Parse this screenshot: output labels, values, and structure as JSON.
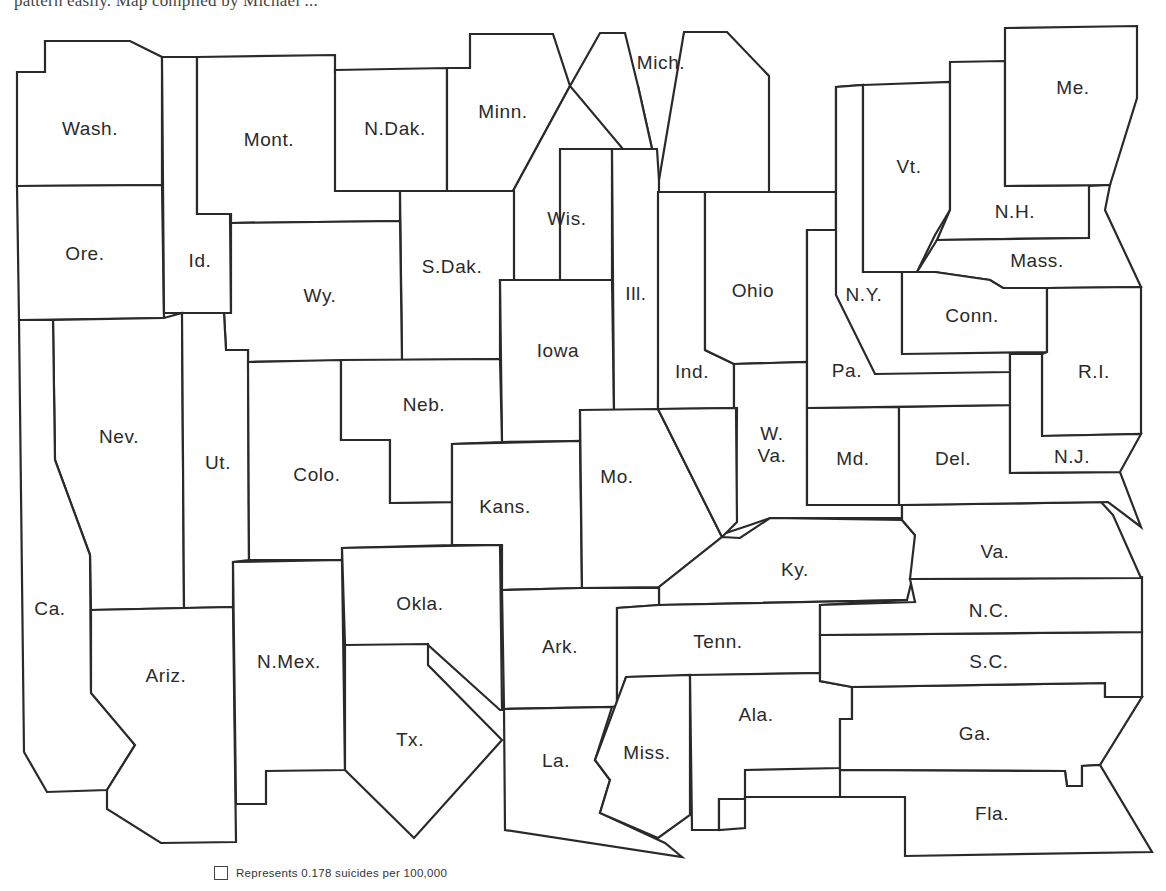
{
  "caption": "pattern easily. Map compiled by Michael ...",
  "legend": {
    "label": "Represents 0.178 suicides per 100,000"
  },
  "map": {
    "type": "cartogram",
    "unit": "0.178 suicides per 100,000",
    "states": [
      {
        "id": "wash",
        "label": "Wash.",
        "lx": 90,
        "ly": 130,
        "points": "17,72 45,72 45,41 130,41 162,57 162,185 17,186"
      },
      {
        "id": "ore",
        "label": "Ore.",
        "lx": 85,
        "ly": 255,
        "points": "17,186 162,185 164,318 19,320"
      },
      {
        "id": "id",
        "label": "Id.",
        "lx": 200,
        "ly": 262,
        "points": "162,57 197,57 197,214 230,214 231,313 164,313"
      },
      {
        "id": "mont",
        "label": "Mont.",
        "lx": 269,
        "ly": 141,
        "points": "197,57 335,55 335,72 400,70 400,191 400,221 231,223 231,214 197,214"
      },
      {
        "id": "ndak",
        "label": "N.Dak.",
        "lx": 395,
        "ly": 130,
        "points": "335,70 447,68 447,191 400,191 335,191"
      },
      {
        "id": "minn",
        "label": "Minn.",
        "lx": 503,
        "ly": 113,
        "points": "447,68 470,68 470,34 553,34 570,86 513,191 447,191"
      },
      {
        "id": "wis",
        "label": "Wis.",
        "lx": 567,
        "ly": 220,
        "points": "513,191 570,86 638,86 659,180 657,280 612,280 612,149 560,149 560,280 514,280"
      },
      {
        "id": "mich",
        "label": "Mich.",
        "lx": 661,
        "ly": 64,
        "points": "570,86 600,33 625,33 638,86 659,180 684,32 727,32 769,76 769,192 659,192"
      },
      {
        "id": "sdak",
        "label": "S.Dak.",
        "lx": 452,
        "ly": 268,
        "points": "400,191 514,191 514,280 500,280 500,359 402,360"
      },
      {
        "id": "wy",
        "label": "Wy.",
        "lx": 320,
        "ly": 297,
        "points": "231,223 400,221 402,360 248,362 248,350 226,350 224,313 231,313"
      },
      {
        "id": "iowa",
        "label": "Iowa",
        "lx": 558,
        "ly": 352,
        "points": "500,280 612,280 614,410 580,410 580,441 502,442"
      },
      {
        "id": "ill",
        "label": "Ill.",
        "lx": 636,
        "ly": 295,
        "points": "612,149 657,149 659,180 658,410 614,410"
      },
      {
        "id": "ind",
        "label": "Ind.",
        "lx": 692,
        "ly": 373,
        "points": "658,192 705,192 705,350 734,364 734,408 658,409"
      },
      {
        "id": "ohio",
        "label": "Ohio",
        "lx": 753,
        "ly": 292,
        "points": "705,192 836,192 836,230 807,230 807,362 734,364 705,350"
      },
      {
        "id": "wva",
        "label": "W.\nVa.",
        "lx": 772,
        "ly": 446,
        "points": "734,364 807,362 807,408 807,505 902,505 902,518 770,518 750,525 720,535 736,522 737,408 734,408"
      },
      {
        "id": "nev",
        "label": "Nev.",
        "lx": 119,
        "ly": 438,
        "points": "53,320 164,318 182,313 184,608 91,610 90,555 55,460"
      },
      {
        "id": "ut",
        "label": "Ut.",
        "lx": 218,
        "ly": 464,
        "points": "182,313 224,313 226,350 248,350 249,560 233,562 233,607 184,608"
      },
      {
        "id": "colo",
        "label": "Colo.",
        "lx": 317,
        "ly": 476,
        "points": "248,362 341,360 341,440 390,440 390,503 452,502 452,545 342,548 342,560 249,560"
      },
      {
        "id": "neb",
        "label": "Neb.",
        "lx": 424,
        "ly": 406,
        "points": "341,360 500,359 502,442 452,444 452,502 390,503 390,440 341,440"
      },
      {
        "id": "kans",
        "label": "Kans.",
        "lx": 505,
        "ly": 508,
        "points": "452,444 580,441 582,588 502,590 502,545 452,545"
      },
      {
        "id": "mo",
        "label": "Mo.",
        "lx": 617,
        "ly": 478,
        "points": "580,410 658,409 722,537 659,587 582,588"
      },
      {
        "id": "ky",
        "label": "Ky.",
        "lx": 795,
        "ly": 571,
        "points": "658,409 736,408 737,522 722,537 659,587 659,605 907,600 915,567 915,535 902,520 770,518 740,538 722,537"
      },
      {
        "id": "ca",
        "label": "Ca.",
        "lx": 50,
        "ly": 610,
        "points": "19,320 53,320 55,460 90,555 91,690 135,745 107,790 47,792 24,752"
      },
      {
        "id": "ariz",
        "label": "Ariz.",
        "lx": 166,
        "ly": 677,
        "points": "91,610 233,607 236,842 161,843 107,809 107,790 135,745 91,693"
      },
      {
        "id": "nmex",
        "label": "N.Mex.",
        "lx": 289,
        "ly": 663,
        "points": "233,562 342,560 345,770 266,771 266,804 236,804"
      },
      {
        "id": "okla",
        "label": "Okla.",
        "lx": 420,
        "ly": 605,
        "points": "342,548 500,545 502,710 500,710 428,645 428,647 345,645"
      },
      {
        "id": "tx",
        "label": "Tx.",
        "lx": 410,
        "ly": 741,
        "points": "345,645 428,644 428,665 502,740 414,838 345,770"
      },
      {
        "id": "ark",
        "label": "Ark.",
        "lx": 560,
        "ly": 648,
        "points": "502,590 582,588 659,588 659,605 617,608 617,706 612,707 504,709"
      },
      {
        "id": "tenn",
        "label": "Tenn.",
        "lx": 718,
        "ly": 643,
        "points": "617,608 659,605 907,600 820,605 820,673 626,677 617,706"
      },
      {
        "id": "la",
        "label": "La.",
        "lx": 556,
        "ly": 762,
        "points": "504,709 612,707 595,760 610,780 600,813 665,843 682,857 505,830"
      },
      {
        "id": "miss",
        "label": "Miss.",
        "lx": 647,
        "ly": 754,
        "points": "626,677 690,675 690,815 658,838 600,813 610,780 595,760"
      },
      {
        "id": "ala",
        "label": "Ala.",
        "lx": 756,
        "ly": 716,
        "points": "690,675 820,673 820,681 852,687 852,719 840,719 840,768 745,770 745,799 719,799 719,830 692,830"
      },
      {
        "id": "ga",
        "label": "Ga.",
        "lx": 975,
        "ly": 735,
        "points": "852,687 1105,683 1105,697 1142,697 1100,765 1082,766 1082,786 1067,786 1065,771 840,770 840,719 852,719"
      },
      {
        "id": "fla",
        "label": "Fla.",
        "lx": 992,
        "ly": 815,
        "points": "719,799 745,799 745,797 905,797 905,856 1152,852 1100,765 1082,766 1082,786 1067,786 1065,771 840,770 840,797 745,797 745,828 719,830"
      },
      {
        "id": "sc",
        "label": "S.C.",
        "lx": 989,
        "ly": 663,
        "points": "820,635 1142,632 1142,697 1105,697 1105,683 852,687 820,681"
      },
      {
        "id": "nc",
        "label": "N.C.",
        "lx": 989,
        "ly": 612,
        "points": "820,605 915,602 910,579 1142,577 1142,632 820,635"
      },
      {
        "id": "va",
        "label": "Va.",
        "lx": 995,
        "ly": 553,
        "points": "902,505 1101,502 1113,515 1141,578 910,579 915,535 902,520"
      },
      {
        "id": "md",
        "label": "Md.",
        "lx": 853,
        "ly": 460,
        "points": "807,408 899,407 899,505 807,505"
      },
      {
        "id": "del",
        "label": "Del.",
        "lx": 953,
        "ly": 460,
        "points": "899,407 1010,405 1010,473 1120,472 1141,527 1108,502 902,505 899,505"
      },
      {
        "id": "pa",
        "label": "Pa.",
        "lx": 847,
        "ly": 372,
        "points": "807,230 836,230 836,87 863,85 863,272 916,272 916,278 902,278 902,352 1010,352 1010,405 807,408"
      },
      {
        "id": "ny",
        "label": "N.Y.",
        "lx": 864,
        "ly": 296,
        "points": "836,87 863,85 863,272 902,272 902,352 1010,352 1010,372 875,374 836,295"
      },
      {
        "id": "vt",
        "label": "Vt.",
        "lx": 909,
        "ly": 168,
        "points": "863,85 950,82 950,210 935,235 917,272 863,272"
      },
      {
        "id": "nh",
        "label": "N.H.",
        "lx": 1015,
        "ly": 213,
        "points": "950,62 1005,61 1005,186 1110,185 1090,176 1089,238 937,240 950,210"
      },
      {
        "id": "me",
        "label": "Me.",
        "lx": 1073,
        "ly": 89,
        "points": "1005,28 1137,26 1137,98 1110,185 1005,186"
      },
      {
        "id": "mass",
        "label": "Mass.",
        "lx": 1037,
        "ly": 262,
        "points": "937,240 1089,238 1089,186 1110,185 1105,210 1141,287 1047,288 1003,288 990,280 935,272 917,272"
      },
      {
        "id": "conn",
        "label": "Conn.",
        "lx": 972,
        "ly": 317,
        "points": "902,272 935,272 990,280 1003,288 1047,288 1047,352 902,354"
      },
      {
        "id": "ri",
        "label": "R.I.",
        "lx": 1094,
        "ly": 373,
        "points": "1047,288 1141,287 1141,434 1042,436 1042,354 1047,352"
      },
      {
        "id": "nj",
        "label": "N.J.",
        "lx": 1072,
        "ly": 458,
        "points": "1010,354 1042,354 1042,436 1141,434 1120,472 1010,473"
      }
    ]
  }
}
